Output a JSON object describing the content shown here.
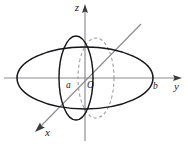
{
  "figure": {
    "kind": "ellipsoid-3d-axes-diagram",
    "background_color": "#ffffff",
    "width": 188,
    "height": 144,
    "axis_color": "#8b8b8b",
    "outline_color": "#16161a",
    "hidden_color": "#9a9a9a"
  },
  "axes": {
    "z": {
      "label": "z",
      "label_x": 79,
      "label_y": 11,
      "line_x": 85,
      "line_y_top": 8,
      "line_y_bottom": 141,
      "arrow_tip_x": 85,
      "arrow_tip_y": 4
    },
    "y": {
      "label": "y",
      "label_x": 174,
      "label_y": 90,
      "line_y": 78,
      "line_x_left": 4,
      "line_x_right": 177,
      "arrow_tip_x": 182,
      "arrow_tip_y": 78
    },
    "x": {
      "label": "x",
      "label_x": 45,
      "label_y": 136,
      "line_x1": 141,
      "line_y1": 24,
      "line_x2": 41,
      "line_y2": 126,
      "arrow_tip_x": 35,
      "arrow_tip_y": 132
    }
  },
  "labels": {
    "a": {
      "text": "a",
      "x": 66,
      "y": 88
    },
    "origin": {
      "text": "O",
      "x": 87,
      "y": 88
    },
    "b": {
      "text": "b",
      "x": 153,
      "y": 89
    }
  },
  "geometry": {
    "equator": {
      "cx": 85,
      "cy": 78,
      "rx": 68,
      "ry": 31
    },
    "hidden_equator_back": {
      "cx": 85,
      "cy": 78,
      "rx": 68,
      "ry": 31
    },
    "section_xz_solid": {
      "cx": 76,
      "cy": 78,
      "rx": 17,
      "ry": 42
    },
    "section_yz_hidden": {
      "cx": 96,
      "cy": 78,
      "rx": 18,
      "ry": 40
    }
  }
}
